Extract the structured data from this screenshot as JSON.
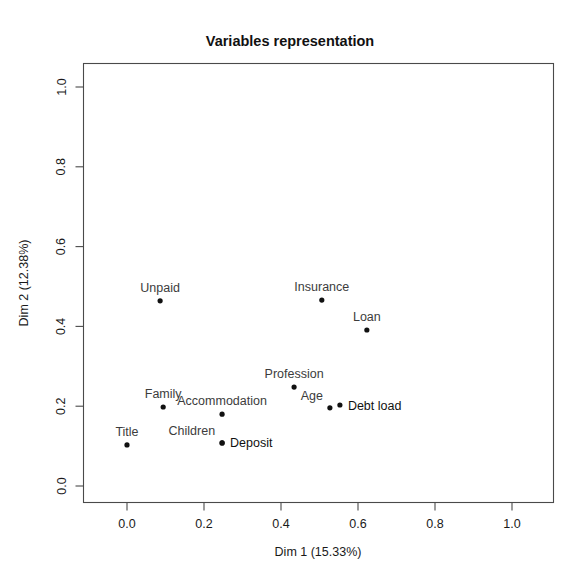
{
  "chart_data": {
    "type": "scatter",
    "title": "Variables representation",
    "xlabel": "Dim 1 (15.33%)",
    "ylabel": "Dim 2 (12.38%)",
    "xlim": [
      -0.07,
      1.11
    ],
    "ylim": [
      -0.04,
      1.04
    ],
    "xticks": [
      "0.0",
      "0.2",
      "0.4",
      "0.6",
      "0.8",
      "1.0"
    ],
    "xtick_values": [
      0.0,
      0.2,
      0.4,
      0.6,
      0.8,
      1.0
    ],
    "yticks": [
      "0.0",
      "0.2",
      "0.4",
      "0.6",
      "0.8",
      "1.0"
    ],
    "ytick_values": [
      0.0,
      0.2,
      0.4,
      0.6,
      0.8,
      1.0
    ],
    "grid": false,
    "legend": "none",
    "point_color": "#111111",
    "label_color": "#3c3c3c",
    "points": [
      {
        "label": "Unpaid",
        "x": 0.086,
        "y": 0.464,
        "label_pos": "above"
      },
      {
        "label": "Insurance",
        "x": 0.506,
        "y": 0.466,
        "label_pos": "above"
      },
      {
        "label": "Loan",
        "x": 0.623,
        "y": 0.391,
        "label_pos": "above"
      },
      {
        "label": "Profession",
        "x": 0.434,
        "y": 0.248,
        "label_pos": "above"
      },
      {
        "label": "Family",
        "x": 0.094,
        "y": 0.198,
        "label_pos": "above"
      },
      {
        "label": "Accommodation",
        "x": 0.247,
        "y": 0.18,
        "label_pos": "above"
      },
      {
        "label": "Age",
        "x": 0.527,
        "y": 0.196,
        "label_pos": "above-left"
      },
      {
        "label": "Debt load",
        "x": 0.553,
        "y": 0.203,
        "label_pos": "right"
      },
      {
        "label": "Title",
        "x": 0.0,
        "y": 0.103,
        "label_pos": "above"
      },
      {
        "label": "Children",
        "x": 0.247,
        "y": 0.108,
        "label_pos": "above-left"
      },
      {
        "label": "Deposit",
        "x": 0.247,
        "y": 0.108,
        "label_pos": "right"
      }
    ]
  }
}
